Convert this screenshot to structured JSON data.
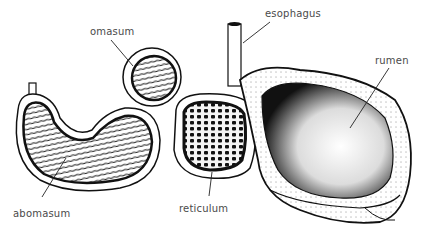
{
  "diagram": {
    "colors": {
      "ink": "#111111",
      "label_text": "#4a4a4a",
      "background": "#ffffff"
    },
    "labels": [
      {
        "id": "omasum",
        "text": "omasum",
        "x": 90,
        "y": 27
      },
      {
        "id": "esophagus",
        "text": "esophagus",
        "x": 265,
        "y": 9
      },
      {
        "id": "rumen",
        "text": "rumen",
        "x": 375,
        "y": 56
      },
      {
        "id": "abomasum",
        "text": "abomasum",
        "x": 13,
        "y": 209
      },
      {
        "id": "reticulum",
        "text": "reticulum",
        "x": 179,
        "y": 204
      }
    ]
  }
}
